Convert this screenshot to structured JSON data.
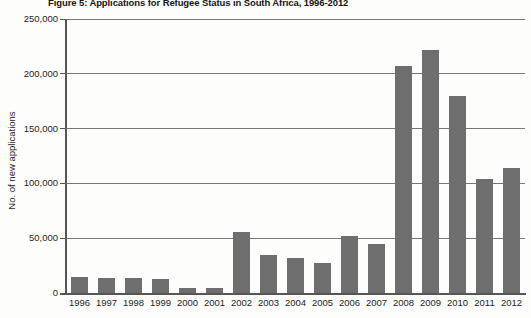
{
  "chart_data": {
    "type": "bar",
    "title": "Figure 5: Applications for Refugee Status in South Africa, 1996-2012",
    "xlabel": "",
    "ylabel": "No. of new applications",
    "categories": [
      "1996",
      "1997",
      "1998",
      "1999",
      "2000",
      "2001",
      "2002",
      "2003",
      "2004",
      "2005",
      "2006",
      "2007",
      "2008",
      "2009",
      "2010",
      "2011",
      "2012"
    ],
    "values": [
      15000,
      14000,
      14000,
      12500,
      4500,
      5000,
      56000,
      35000,
      32000,
      27000,
      52000,
      45000,
      207000,
      222000,
      180000,
      104000,
      114000
    ],
    "ylim": [
      0,
      250000
    ],
    "ytick_values": [
      0,
      50000,
      100000,
      150000,
      200000,
      250000
    ],
    "ytick_labels": [
      "0",
      "50,000",
      "100,000",
      "150,000",
      "200,000",
      "250,000"
    ],
    "grid": true,
    "legend": "none",
    "bar_color": "#6e6e6e",
    "background_color": "#fdfdfc",
    "gridline_color": "#777777",
    "axis_color": "#555555"
  }
}
